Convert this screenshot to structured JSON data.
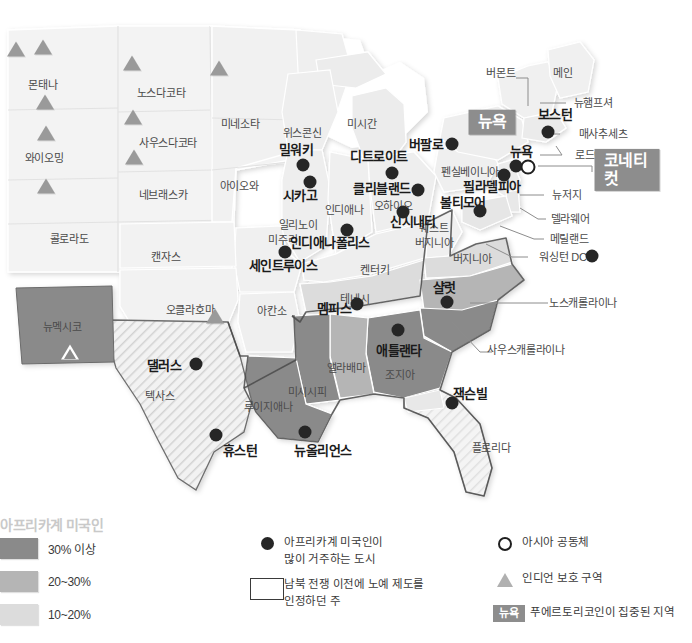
{
  "map": {
    "title": "미국 내 아프리카계 미국인 분포 지도",
    "colors": {
      "tier_30_plus": "#8a8a8a",
      "tier_20_30": "#b5b5b5",
      "tier_10_20": "#dcdcdc",
      "base_state": "#f0f0f0",
      "badge": "#8d8d8d",
      "dot": "#262626",
      "triangle": "#9a9a9a",
      "background": "#ffffff"
    },
    "state_labels": [
      {
        "name": "몬태나",
        "x": 43,
        "y": 85
      },
      {
        "name": "와이오밍",
        "x": 44,
        "y": 158
      },
      {
        "name": "콜로라도",
        "x": 69,
        "y": 239
      },
      {
        "name": "노스다코타",
        "x": 161,
        "y": 93
      },
      {
        "name": "사우스다코타",
        "x": 168,
        "y": 143
      },
      {
        "name": "네브래스카",
        "x": 163,
        "y": 195
      },
      {
        "name": "캔자스",
        "x": 166,
        "y": 257
      },
      {
        "name": "미네소타",
        "x": 240,
        "y": 124
      },
      {
        "name": "아이오와",
        "x": 239,
        "y": 186
      },
      {
        "name": "미주리",
        "x": 283,
        "y": 240
      },
      {
        "name": "위스콘신",
        "x": 302,
        "y": 133
      },
      {
        "name": "일리노이",
        "x": 298,
        "y": 225
      },
      {
        "name": "인디애나",
        "x": 344,
        "y": 210
      },
      {
        "name": "미시간",
        "x": 362,
        "y": 124
      },
      {
        "name": "오하이오",
        "x": 393,
        "y": 206
      },
      {
        "name": "켄터키",
        "x": 375,
        "y": 270
      },
      {
        "name": "테네시",
        "x": 355,
        "y": 299
      },
      {
        "name": "아칸소",
        "x": 272,
        "y": 311
      },
      {
        "name": "오클라호마",
        "x": 190,
        "y": 310
      },
      {
        "name": "뉴멕시코",
        "x": 62,
        "y": 327
      },
      {
        "name": "텍사스",
        "x": 160,
        "y": 396
      },
      {
        "name": "루이지애나",
        "x": 268,
        "y": 407
      },
      {
        "name": "미시시피",
        "x": 307,
        "y": 392
      },
      {
        "name": "앨라배마",
        "x": 346,
        "y": 368
      },
      {
        "name": "조지아",
        "x": 400,
        "y": 375
      },
      {
        "name": "플로리다",
        "x": 491,
        "y": 448
      },
      {
        "name": "웨스트",
        "x": 434,
        "y": 228
      },
      {
        "name": "버지니아",
        "x": 434,
        "y": 243
      },
      {
        "name": "버지니아",
        "x": 472,
        "y": 259
      },
      {
        "name": "펜실베이니아",
        "x": 470,
        "y": 172
      },
      {
        "name": "버몬트",
        "x": 501,
        "y": 73
      },
      {
        "name": "메인",
        "x": 563,
        "y": 73
      }
    ],
    "city_labels": [
      {
        "name": "밀워키",
        "x": 296,
        "y": 150,
        "size": "md"
      },
      {
        "name": "시카고",
        "x": 300,
        "y": 196,
        "size": "md"
      },
      {
        "name": "디트로이트",
        "x": 379,
        "y": 157,
        "size": "md"
      },
      {
        "name": "클리블랜드",
        "x": 382,
        "y": 189,
        "size": "md"
      },
      {
        "name": "신시내티",
        "x": 413,
        "y": 222,
        "size": "md"
      },
      {
        "name": "인디애나폴리스",
        "x": 330,
        "y": 243,
        "size": "md"
      },
      {
        "name": "세인트루이스",
        "x": 283,
        "y": 266,
        "size": "md"
      },
      {
        "name": "버팔로",
        "x": 426,
        "y": 145,
        "size": "md"
      },
      {
        "name": "필라델피아",
        "x": 492,
        "y": 187,
        "size": "md"
      },
      {
        "name": "볼티모어",
        "x": 463,
        "y": 203,
        "size": "md"
      },
      {
        "name": "보스턴",
        "x": 555,
        "y": 115,
        "size": "md"
      },
      {
        "name": "뉴욕",
        "x": 521,
        "y": 152,
        "size": "md"
      },
      {
        "name": "멤피스",
        "x": 334,
        "y": 309,
        "size": "md"
      },
      {
        "name": "샬럿",
        "x": 444,
        "y": 288,
        "size": "md"
      },
      {
        "name": "애틀랜타",
        "x": 399,
        "y": 351,
        "size": "md"
      },
      {
        "name": "잭슨빌",
        "x": 470,
        "y": 394,
        "size": "md"
      },
      {
        "name": "댈러스",
        "x": 164,
        "y": 366,
        "size": "md"
      },
      {
        "name": "휴스턴",
        "x": 240,
        "y": 451,
        "size": "md"
      },
      {
        "name": "뉴올리언스",
        "x": 323,
        "y": 451,
        "size": "md"
      }
    ],
    "callout_labels": [
      {
        "name": "뉴햄프셔",
        "x": 593,
        "y": 103
      },
      {
        "name": "매사추세츠",
        "x": 603,
        "y": 134
      },
      {
        "name": "로드아일랜드",
        "x": 604,
        "y": 155
      },
      {
        "name": "뉴저지",
        "x": 567,
        "y": 195
      },
      {
        "name": "델라웨어",
        "x": 570,
        "y": 219
      },
      {
        "name": "메릴랜드",
        "x": 569,
        "y": 239
      },
      {
        "name": "워싱턴 DC",
        "x": 563,
        "y": 257
      },
      {
        "name": "노스캐롤라이나",
        "x": 583,
        "y": 303
      },
      {
        "name": "사우스캐롤라이나",
        "x": 526,
        "y": 350
      }
    ],
    "badges": [
      {
        "name": "뉴욕",
        "x": 492,
        "y": 122,
        "size": "big"
      },
      {
        "name": "코네티컷",
        "x": 627,
        "y": 170,
        "size": "big"
      }
    ],
    "city_dots": [
      {
        "x": 303,
        "y": 165
      },
      {
        "x": 310,
        "y": 182
      },
      {
        "x": 392,
        "y": 173
      },
      {
        "x": 418,
        "y": 190
      },
      {
        "x": 403,
        "y": 212
      },
      {
        "x": 347,
        "y": 230
      },
      {
        "x": 285,
        "y": 252
      },
      {
        "x": 452,
        "y": 144
      },
      {
        "x": 504,
        "y": 175
      },
      {
        "x": 480,
        "y": 211
      },
      {
        "x": 548,
        "y": 132
      },
      {
        "x": 516,
        "y": 166
      },
      {
        "x": 592,
        "y": 256
      },
      {
        "x": 357,
        "y": 304
      },
      {
        "x": 447,
        "y": 302
      },
      {
        "x": 398,
        "y": 330
      },
      {
        "x": 452,
        "y": 403
      },
      {
        "x": 196,
        "y": 364
      },
      {
        "x": 216,
        "y": 435
      },
      {
        "x": 305,
        "y": 432
      }
    ],
    "asian_rings": [
      {
        "x": 528,
        "y": 167
      }
    ],
    "reservation_triangles": [
      {
        "x": 16,
        "y": 49
      },
      {
        "x": 43,
        "y": 47
      },
      {
        "x": 45,
        "y": 102
      },
      {
        "x": 46,
        "y": 133
      },
      {
        "x": 46,
        "y": 186
      },
      {
        "x": 132,
        "y": 63
      },
      {
        "x": 133,
        "y": 117
      },
      {
        "x": 134,
        "y": 157
      },
      {
        "x": 219,
        "y": 68
      },
      {
        "x": 215,
        "y": 316
      }
    ],
    "hollow_triangles": [
      {
        "x": 70,
        "y": 352
      }
    ]
  },
  "legend": {
    "title": "아프리카계 미국인",
    "swatches": [
      {
        "label": "30% 이상",
        "color": "#8a8a8a"
      },
      {
        "label": "20~30%",
        "color": "#b5b5b5"
      },
      {
        "label": "10~20%",
        "color": "#dcdcdc"
      }
    ],
    "keys": [
      {
        "icon": "filled-circle-icon",
        "line1": "아프리카계 미국인이",
        "line2": "많이 거주하는 도시"
      },
      {
        "icon": "outlined-rectangle-icon",
        "line1": "남북 전쟁 이전에 노예 제도를",
        "line2": "인정하던 주"
      },
      {
        "icon": "hollow-circle-icon",
        "line1": "아시아 공동체",
        "line2": ""
      },
      {
        "icon": "triangle-icon",
        "line1": "인디언 보호 구역",
        "line2": ""
      },
      {
        "icon": "gray-badge-icon",
        "badge": "뉴욕",
        "line1": "푸에르토리코인이 집중된 지역",
        "line2": ""
      }
    ]
  }
}
